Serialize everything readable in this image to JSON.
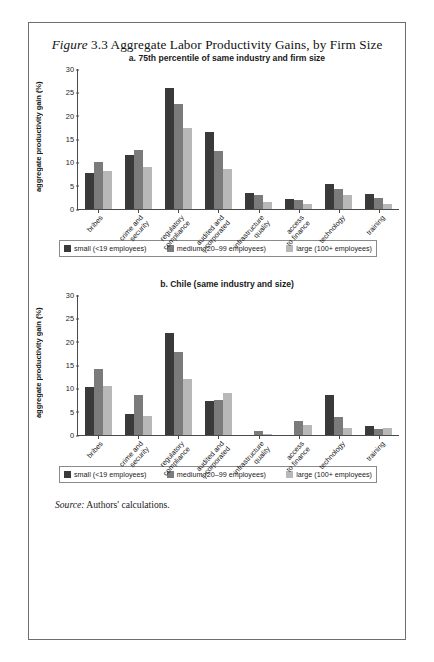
{
  "figure": {
    "label": "Figure",
    "number": "3.3",
    "title": "Aggregate Labor Productivity Gains, by Firm Size",
    "source_label": "Source:",
    "source_text": "Authors' calculations."
  },
  "legend": {
    "items": [
      {
        "label": "small (<19 employees)",
        "color": "#3a3a3a",
        "key": "small"
      },
      {
        "label": "medium (20–99 employees)",
        "color": "#7b7b7b",
        "key": "medium"
      },
      {
        "label": "large (100+ employees)",
        "color": "#b8b8b8",
        "key": "large"
      }
    ]
  },
  "chart_data": [
    {
      "type": "bar",
      "panel": "a",
      "title": "a. 75th percentile of same industry and firm size",
      "xlabel": "",
      "ylabel": "aggregate productivity gain (%)",
      "ylim": [
        0,
        30
      ],
      "yticks": [
        0,
        5,
        10,
        15,
        20,
        25,
        30
      ],
      "ytick_labels": [
        "0",
        "5",
        "10",
        "15",
        "20",
        "25",
        "30"
      ],
      "grid": false,
      "legend_position": "bottom",
      "categories": [
        "bribes",
        "crime and security",
        "regulatory compliance",
        "audited and incorporated",
        "infrastructure quality",
        "access to finance",
        "technology",
        "training"
      ],
      "category_lines": [
        [
          "bribes"
        ],
        [
          "crime and",
          "security"
        ],
        [
          "regulatory",
          "compliance"
        ],
        [
          "audited and",
          "incorporated"
        ],
        [
          "infrastructure",
          "quality"
        ],
        [
          "access",
          "to finance"
        ],
        [
          "technology"
        ],
        [
          "training"
        ]
      ],
      "series": [
        {
          "name": "small (<19 employees)",
          "color": "#3a3a3a",
          "values": [
            7.8,
            11.5,
            26.0,
            16.6,
            3.5,
            2.2,
            5.4,
            3.3
          ]
        },
        {
          "name": "medium (20–99 employees)",
          "color": "#7b7b7b",
          "values": [
            10.1,
            12.7,
            22.6,
            12.4,
            2.9,
            2.0,
            4.3,
            2.3
          ]
        },
        {
          "name": "large (100+ employees)",
          "color": "#b8b8b8",
          "values": [
            8.1,
            9.1,
            17.4,
            8.5,
            1.6,
            1.0,
            2.9,
            1.1
          ]
        }
      ]
    },
    {
      "type": "bar",
      "panel": "b",
      "title": "b. Chile (same industry and size)",
      "xlabel": "",
      "ylabel": "aggregate productivity gain (%)",
      "ylim": [
        0,
        30
      ],
      "yticks": [
        0,
        5,
        10,
        15,
        20,
        25,
        30
      ],
      "ytick_labels": [
        "0",
        "5",
        "10",
        "15",
        "20",
        "25",
        "30"
      ],
      "grid": false,
      "legend_position": "bottom",
      "categories": [
        "bribes",
        "crime and security",
        "regulatory compliance",
        "audited and incorporated",
        "infrastructure quality",
        "access to finance",
        "technology",
        "training"
      ],
      "category_lines": [
        [
          "bribes"
        ],
        [
          "crime and",
          "security"
        ],
        [
          "regulatory",
          "compliance"
        ],
        [
          "audited and",
          "incorporated"
        ],
        [
          "infrastructure",
          "quality"
        ],
        [
          "access",
          "to finance"
        ],
        [
          "technology"
        ],
        [
          "training"
        ]
      ],
      "series": [
        {
          "name": "small (<19 employees)",
          "color": "#3a3a3a",
          "values": [
            10.3,
            4.6,
            21.8,
            7.3,
            0.0,
            0.0,
            8.5,
            2.0
          ]
        },
        {
          "name": "medium (20–99 employees)",
          "color": "#7b7b7b",
          "values": [
            14.1,
            8.5,
            17.7,
            7.6,
            0.9,
            3.0,
            3.9,
            1.3
          ]
        },
        {
          "name": "large (100+ employees)",
          "color": "#b8b8b8",
          "values": [
            10.6,
            4.1,
            11.9,
            8.9,
            0.2,
            2.2,
            1.5,
            1.5
          ]
        }
      ]
    }
  ]
}
